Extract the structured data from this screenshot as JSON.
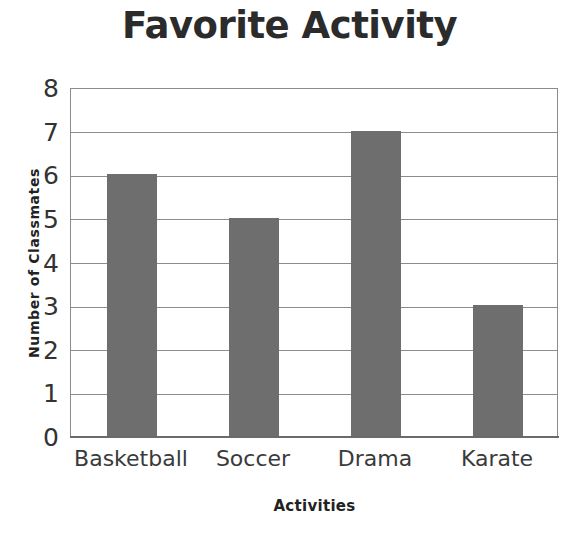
{
  "chart_data": {
    "type": "bar",
    "title": "Favorite Activity",
    "xlabel": "Activities",
    "ylabel": "Number of Classmates",
    "categories": [
      "Basketball",
      "Soccer",
      "Drama",
      "Karate"
    ],
    "values": [
      6,
      5,
      7,
      3
    ],
    "ylim": [
      0,
      8
    ],
    "ytick_labels": [
      "8",
      "7",
      "6",
      "5",
      "4",
      "3",
      "2",
      "1",
      "0"
    ],
    "ytick_values": [
      8,
      7,
      6,
      5,
      4,
      3,
      2,
      1,
      0
    ],
    "ytick_step": 1,
    "grid": true,
    "grid_axis": "y",
    "legend": false,
    "legend_position": "none",
    "bar_color": "#6e6e6e",
    "grid_color": "#8c8c8c",
    "axis_color": "#6b6b6b",
    "background_color": "#ffffff",
    "title_color": "#2b2b2b",
    "tick_label_color": "#333333"
  }
}
